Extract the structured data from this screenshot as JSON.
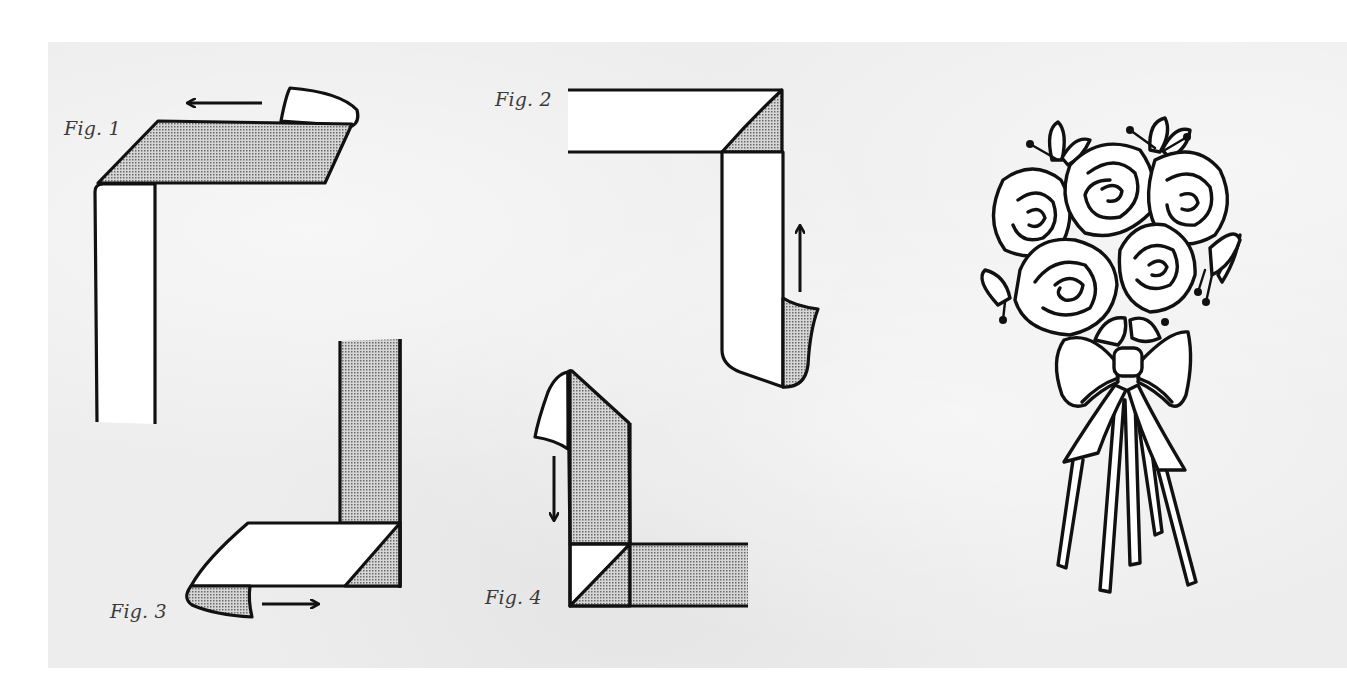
{
  "figures": [
    {
      "id": "fig1",
      "label": "Fig. 1",
      "arrow_direction": "left",
      "description": "Ribbon folded horizontally, shaded underside showing, end curling back"
    },
    {
      "id": "fig2",
      "label": "Fig. 2",
      "arrow_direction": "up",
      "description": "Mitered corner with shaded triangle, vertical strip end curling"
    },
    {
      "id": "fig3",
      "label": "Fig. 3",
      "arrow_direction": "right",
      "description": "Vertical shaded strip with white horizontal fold, end curling"
    },
    {
      "id": "fig4",
      "label": "Fig. 4",
      "arrow_direction": "down",
      "description": "Vertical shaded strip folded down over horizontal strip forming mitered corner"
    }
  ],
  "illustration": {
    "subject": "rose bouquet with bow and ribbon streamers",
    "rose_count": 5
  },
  "colors": {
    "paper": "#ededed",
    "ink": "#111111",
    "ribbon_face": "#ffffff",
    "ribbon_shade": "#b9b9b9"
  }
}
